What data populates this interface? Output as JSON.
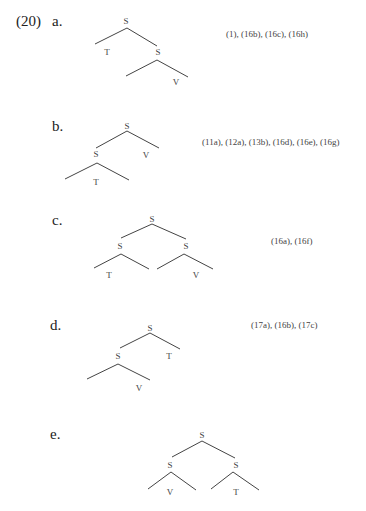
{
  "example_number": "(20)",
  "items": [
    {
      "label": "a.",
      "refs": "(1), (16b), (16c), (16h)",
      "nodes": [
        "S",
        "T",
        "S",
        "V"
      ]
    },
    {
      "label": "b.",
      "refs": "(11a), (12a), (13b), (16d), (16e), (16g)",
      "nodes": [
        "S",
        "S",
        "V",
        "T"
      ]
    },
    {
      "label": "c.",
      "refs": "(16a), (16f)",
      "nodes": [
        "S",
        "S",
        "S",
        "T",
        "V"
      ]
    },
    {
      "label": "d.",
      "refs": "(17a), (16b), (17c)",
      "nodes": [
        "S",
        "S",
        "T",
        "V"
      ]
    },
    {
      "label": "e.",
      "refs": "",
      "nodes": [
        "S",
        "S",
        "S",
        "V",
        "T"
      ]
    }
  ]
}
